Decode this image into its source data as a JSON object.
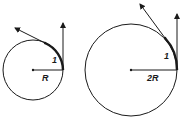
{
  "diagrams": [
    {
      "name": "small-circle",
      "circle": {
        "cx": 33,
        "cy": 70,
        "r": 30
      },
      "radius_label": "R",
      "arc_label": "1",
      "radius_label_pos": [
        46,
        80
      ],
      "arc_label_pos": [
        53,
        63
      ],
      "vertical_arrow": {
        "x": 63,
        "y1": 70,
        "y2": 23
      },
      "tangent_arrow": {
        "x1": 45,
        "y1": 43,
        "x2": 15,
        "y2": 28
      },
      "arc_path": "M63,70 A30,30 0 0,0 45,43"
    },
    {
      "name": "large-circle",
      "circle": {
        "cx": 131,
        "cy": 70,
        "r": 46
      },
      "radius_label": "2R",
      "arc_label": "1",
      "radius_label_pos": [
        150,
        80
      ],
      "arc_label_pos": [
        166,
        58
      ],
      "vertical_arrow": {
        "x": 177,
        "y1": 70,
        "y2": 14
      },
      "tangent_arrow": {
        "x1": 165,
        "y1": 38,
        "x2": 140,
        "y2": 4
      },
      "arc_path": "M177,70 A46,46 0 0,0 165,38"
    }
  ],
  "colors": {
    "stroke": "#1a1a1a",
    "background": "#ffffff"
  }
}
